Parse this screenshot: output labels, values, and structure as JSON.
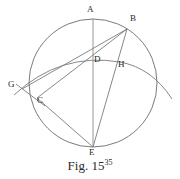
{
  "figure": {
    "caption_text": "Fig. 15",
    "caption_superscript": "35",
    "stroke_color": "#6b6b6b",
    "label_color": "#2b2b2b",
    "background_color": "#ffffff"
  },
  "points": [
    {
      "id": "A",
      "label": "A",
      "x": 93,
      "y": 19,
      "label_x": 89,
      "label_y": 7
    },
    {
      "id": "B",
      "label": "B",
      "x": 127,
      "y": 29,
      "label_x": 130,
      "label_y": 18
    },
    {
      "id": "D",
      "label": "D",
      "x": 92,
      "y": 53,
      "label_x": 94,
      "label_y": 56
    },
    {
      "id": "H",
      "label": "H",
      "x": 116,
      "y": 62,
      "label_x": 118,
      "label_y": 61
    },
    {
      "id": "G",
      "label": "G",
      "x": 21,
      "y": 88,
      "label_x": 10,
      "label_y": 83
    },
    {
      "id": "C",
      "label": "C",
      "x": 37,
      "y": 98,
      "label_x": 37,
      "label_y": 95
    },
    {
      "id": "E",
      "label": "E",
      "x": 93,
      "y": 147,
      "label_x": 90,
      "label_y": 148
    }
  ],
  "circle": {
    "name": "main-circle",
    "cx": 93,
    "cy": 83,
    "r": 64
  },
  "arc": {
    "name": "secondary-arc",
    "description": "arc passing through G, D and H extending beyond the circle to the right",
    "path": "M 14 95 Q 60 52 120 62 Q 152 68 172 99"
  },
  "segments": [
    {
      "name": "segment-A-E",
      "from": "A",
      "to": "E"
    },
    {
      "name": "segment-B-E",
      "from": "B",
      "to": "E"
    },
    {
      "name": "segment-C-E",
      "from": "C",
      "to": "E"
    },
    {
      "name": "segment-G-B",
      "from": "G",
      "to": "B"
    },
    {
      "name": "segment-C-B",
      "from": "C",
      "to": "B"
    },
    {
      "name": "segment-B-H-extend",
      "from": "B",
      "to": "E"
    }
  ]
}
